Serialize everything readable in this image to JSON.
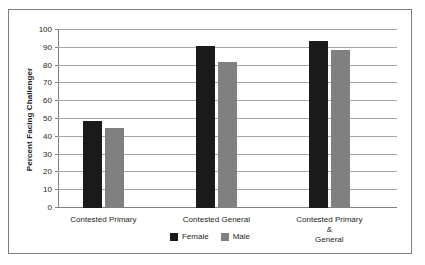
{
  "chart_data": {
    "type": "bar",
    "title": "",
    "xlabel": "",
    "ylabel": "Percent Facing Challenger",
    "ylim": [
      0,
      100
    ],
    "yticks": [
      0,
      10,
      20,
      30,
      40,
      50,
      60,
      70,
      80,
      90,
      100
    ],
    "grid": true,
    "legend_position": "bottom",
    "categories": [
      "Contested Primary",
      "Contested General",
      "Contested Primary &\nGeneral"
    ],
    "series": [
      {
        "name": "Female",
        "color": "#1a1a1a",
        "values": [
          49,
          91,
          94
        ]
      },
      {
        "name": "Male",
        "color": "#808080",
        "values": [
          45,
          82,
          89
        ]
      }
    ]
  },
  "legend": {
    "items": [
      {
        "label": "Female"
      },
      {
        "label": "Male"
      }
    ]
  }
}
